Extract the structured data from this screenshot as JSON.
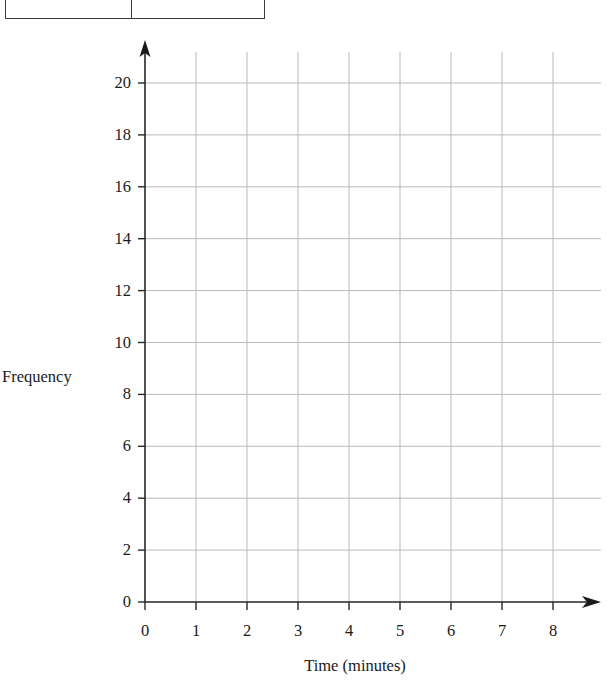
{
  "table_fragment": {
    "cells": [
      "1",
      "2"
    ]
  },
  "chart_data": {
    "type": "line",
    "title": "",
    "xlabel": "Time (minutes)",
    "ylabel": "Frequency",
    "xlim": [
      0,
      8
    ],
    "ylim": [
      0,
      20
    ],
    "x_ticks": [
      "0",
      "1",
      "2",
      "3",
      "4",
      "5",
      "6",
      "7",
      "8"
    ],
    "x_tick_values": [
      0,
      1,
      2,
      3,
      4,
      5,
      6,
      7,
      8
    ],
    "y_ticks": [
      "0",
      "2",
      "4",
      "6",
      "8",
      "10",
      "12",
      "14",
      "16",
      "18",
      "20"
    ],
    "y_tick_values": [
      0,
      2,
      4,
      6,
      8,
      10,
      12,
      14,
      16,
      18,
      20
    ],
    "grid": true,
    "grid_color": "#b9b9b9",
    "axis_color": "#262626",
    "legend": null,
    "series": [],
    "values": [],
    "categories": [],
    "annotations": []
  },
  "colors": {
    "page_background": "#ffffff",
    "ink": "#1a1a1a",
    "axis": "#262626",
    "gridline": "#b9b9b9",
    "table_border": "#3a3a3a"
  }
}
